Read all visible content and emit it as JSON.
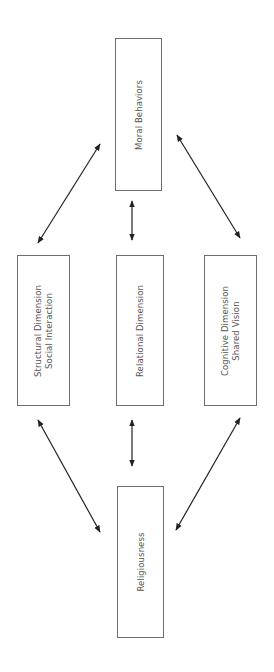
{
  "diagram": {
    "nodes": {
      "moral": {
        "lines": [
          "Moral Behaviors"
        ]
      },
      "structural": {
        "lines": [
          "Structural Dimension",
          "Social Interaction"
        ]
      },
      "relational": {
        "lines": [
          "Relational Dimension"
        ]
      },
      "cognitive": {
        "lines": [
          "Cognitive Dimension",
          "Shared Vision"
        ]
      },
      "religiousness": {
        "lines": [
          "Religiousness"
        ]
      }
    },
    "edges": [
      {
        "from": "moral",
        "to": "structural",
        "type": "bidirectional"
      },
      {
        "from": "moral",
        "to": "relational",
        "type": "bidirectional"
      },
      {
        "from": "moral",
        "to": "cognitive",
        "type": "bidirectional"
      },
      {
        "from": "structural",
        "to": "religiousness",
        "type": "bidirectional"
      },
      {
        "from": "relational",
        "to": "religiousness",
        "type": "bidirectional"
      },
      {
        "from": "cognitive",
        "to": "religiousness",
        "type": "bidirectional"
      }
    ],
    "colors": {
      "box_border": "#6e6e6e",
      "text": "#555555",
      "arrow": "#222222",
      "background": "#ffffff"
    }
  }
}
